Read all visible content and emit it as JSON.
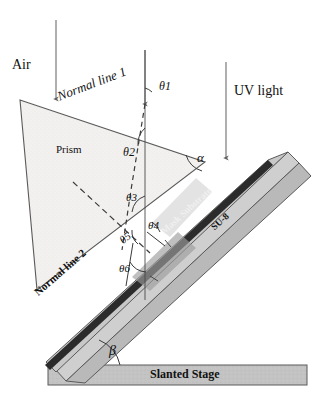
{
  "figure": {
    "type": "optical-lithography-schematic",
    "title_visible": false,
    "colors": {
      "stroke": "#5a5a5a",
      "prism_fill": "#f2f1ef",
      "slab_fill": "#b9b9b9",
      "su8_fill": "#cfcfcf",
      "mask_fill": "#2b2b2b",
      "stage_fill": "#c3c3c3",
      "beam": "#6d6d6d",
      "text": "#111111"
    }
  },
  "labels": {
    "air": "Air",
    "uv_light": "UV light",
    "prism": "Prism",
    "normal_line_1": "Normal line 1",
    "normal_line_2": "Normal line 2",
    "mask_substrate": "Mask Substrate",
    "su8": "SU-8",
    "slanted_stage": "Slanted Stage"
  },
  "angles": {
    "theta1": {
      "symbol": "θ",
      "subscript": "1",
      "text": "θ1"
    },
    "theta2": {
      "symbol": "θ",
      "subscript": "2",
      "text": "θ2"
    },
    "theta3": {
      "symbol": "θ",
      "subscript": "3",
      "text": "θ3"
    },
    "theta4": {
      "symbol": "θ",
      "subscript": "4",
      "text": "θ4"
    },
    "theta5": {
      "symbol": "θ",
      "subscript": "5",
      "text": "θ5"
    },
    "theta6": {
      "symbol": "θ",
      "subscript": "6",
      "text": "θ6"
    },
    "alpha": {
      "symbol": "α",
      "subscript": "",
      "text": "α"
    },
    "beta": {
      "symbol": "β",
      "subscript": "",
      "text": "β"
    }
  },
  "beams": [
    {
      "name": "uv-beam-left",
      "x": 56,
      "y_top": 20,
      "y_bottom": 101
    },
    {
      "name": "uv-beam-center",
      "x": 145,
      "y_top": 50,
      "y_bottom": 106
    },
    {
      "name": "uv-beam-right",
      "x": 226,
      "y_top": 62,
      "y_bottom": 160
    }
  ],
  "geometry": {
    "prism_points": "20,100 37,290 205,162",
    "stage_rect": {
      "x": 48,
      "y": 365,
      "w": 259,
      "h": 20
    }
  }
}
